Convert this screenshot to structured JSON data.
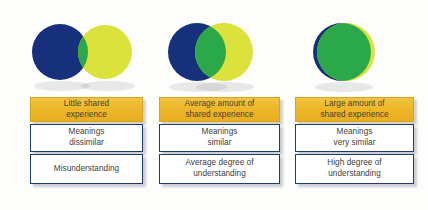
{
  "diagram": {
    "type": "venn-overlap-progression",
    "palette": {
      "circle_blue": "#16307c",
      "circle_yellow": "#dbe23c",
      "overlap_green": "#2aa84a",
      "header_gold": "#edb729",
      "box_border_navy": "#1d3b72",
      "box_background": "#ffffff",
      "text_dark": "#3d3d3d",
      "canvas_background": "#fdfdfb"
    },
    "columns": [
      {
        "id": "little-shared-experience",
        "venn": {
          "name": "venn-little-overlap",
          "blue_circle": {
            "cx": 60,
            "cy": 40,
            "r": 28
          },
          "yellow_circle": {
            "cx": 105,
            "cy": 40,
            "r": 27
          },
          "overlap": "small"
        },
        "header": "Little shared\nexperience",
        "meanings": "Meanings\ndissimilar",
        "outcome": "Misunderstanding"
      },
      {
        "id": "average-shared-experience",
        "venn": {
          "name": "venn-average-overlap",
          "blue_circle": {
            "cx": 197,
            "cy": 40,
            "r": 29
          },
          "yellow_circle": {
            "cx": 224,
            "cy": 40,
            "r": 29
          },
          "overlap": "medium"
        },
        "header": "Average amount of\nshared experience",
        "meanings": "Meanings\nsimilar",
        "outcome": "Average degree of\nunderstanding"
      },
      {
        "id": "large-shared-experience",
        "venn": {
          "name": "venn-large-overlap",
          "blue_circle": {
            "cx": 342,
            "cy": 40,
            "r": 29
          },
          "yellow_circle": {
            "cx": 346,
            "cy": 40,
            "r": 29
          },
          "overlap": "almost-complete"
        },
        "header": "Large amount of\nshared experience",
        "meanings": "Meanings\nvery similar",
        "outcome": "High degree of\nunderstanding"
      }
    ]
  }
}
